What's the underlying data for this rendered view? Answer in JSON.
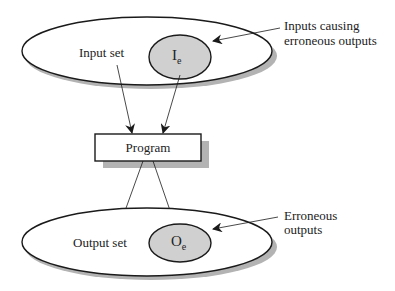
{
  "diagram": {
    "input_set_label": "Input set",
    "input_error_label": "I",
    "input_error_sub": "e",
    "input_callout_line1": "Inputs causing",
    "input_callout_line2": "erroneous outputs",
    "program_label": "Program",
    "output_set_label": "Output set",
    "output_error_label": "O",
    "output_error_sub": "e",
    "output_callout_line1": "Erroneous",
    "output_callout_line2": "outputs"
  },
  "colors": {
    "stroke": "#1a1a1a",
    "shadow": "#b3b3b3",
    "error_fill": "#d0d0d0",
    "background": "#ffffff"
  }
}
